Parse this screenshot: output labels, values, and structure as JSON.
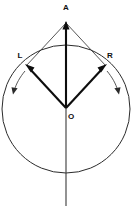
{
  "figure": {
    "title": "",
    "background_color": "#ffffff",
    "width": 133,
    "height": 208
  },
  "labels": {
    "apex": "A",
    "left": "L",
    "right": "R",
    "center": "O"
  },
  "geometry": {
    "circle": {
      "center_x": 66,
      "center_y": 109,
      "radius": 64,
      "stroke": "#2b2b2b"
    },
    "points": {
      "A": {
        "x": 66,
        "y": 22
      },
      "L": {
        "x": 26,
        "y": 66
      },
      "R": {
        "x": 106,
        "y": 66
      },
      "O": {
        "x": 66,
        "y": 109
      }
    },
    "label_positions": {
      "A": {
        "x": 66,
        "y": 8
      },
      "L": {
        "x": 20,
        "y": 56
      },
      "R": {
        "x": 110,
        "y": 56
      },
      "O": {
        "x": 71,
        "y": 117
      }
    },
    "axis": {
      "x": 66,
      "y_top": 22,
      "y_bottom": 206
    },
    "left_rotation_arrow": {
      "start_x": 24,
      "start_y": 72,
      "end_x": 14,
      "end_y": 91,
      "direction": "counterclockwise-outward"
    },
    "right_rotation_arrow": {
      "start_x": 108,
      "start_y": 72,
      "end_x": 118,
      "end_y": 91,
      "direction": "clockwise-outward"
    }
  },
  "colors": {
    "line_dark": "#0d0d0d",
    "line_mid": "#2b2b2b",
    "line_light": "#3a3a3a",
    "background": "#ffffff"
  }
}
